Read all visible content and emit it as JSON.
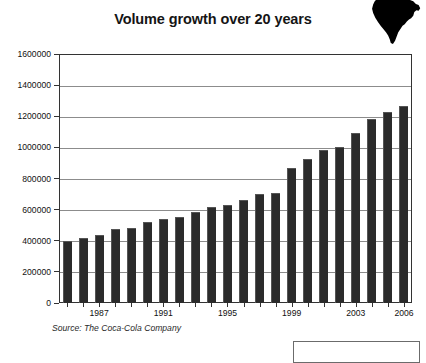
{
  "chart_data": {
    "type": "bar",
    "title": "Volume growth over 20 years",
    "xlabel": "",
    "ylabel": "",
    "ylim": [
      0,
      1600000
    ],
    "ytick_values": [
      0,
      200000,
      400000,
      600000,
      800000,
      1000000,
      1200000,
      1400000,
      1600000
    ],
    "ytick_labels": [
      "0",
      "200000",
      "400000",
      "600000",
      "800000",
      "1000000",
      "1200000",
      "1400000",
      "1600000"
    ],
    "grid": true,
    "legend": null,
    "categories": [
      "1985",
      "1986",
      "1987",
      "1988",
      "1989",
      "1990",
      "1991",
      "1992",
      "1993",
      "1994",
      "1995",
      "1996",
      "1997",
      "1998",
      "1999",
      "2000",
      "2001",
      "2002",
      "2003",
      "2004",
      "2005",
      "2006"
    ],
    "values": [
      400000,
      415000,
      435000,
      475000,
      480000,
      520000,
      540000,
      555000,
      585000,
      615000,
      630000,
      660000,
      700000,
      705000,
      865000,
      925000,
      985000,
      1000000,
      1090000,
      1185000,
      1230000,
      1265000
    ],
    "xtick_labels": [
      "1987",
      "1991",
      "1995",
      "1999",
      "2003",
      "2006"
    ],
    "bar_color": "#2b2b2b",
    "grid_color": "#8c8c8c",
    "axis_color": "#333333"
  },
  "source_note": "Source: The Coca-Cola Company",
  "logo": {
    "name": "africa-map-silhouette",
    "color": "#000000"
  },
  "legend_box": {
    "label": ""
  }
}
